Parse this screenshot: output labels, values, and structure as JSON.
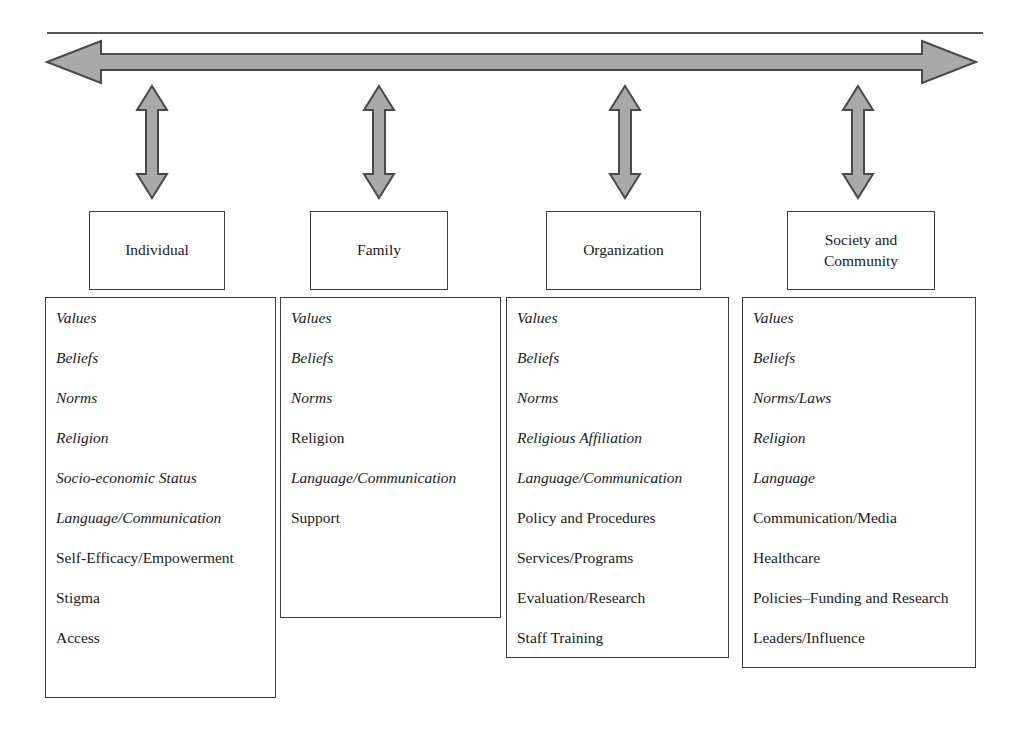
{
  "figure": {
    "colors": {
      "arrow_fill": "#a9a9a9",
      "arrow_stroke": "#4a4a4a",
      "box_border": "#3c3c3c",
      "rule": "#555555",
      "text": "#1a1a1a"
    }
  },
  "top_rule": {
    "label": "top-horizontal-rule"
  },
  "bottom_rule": {
    "label": "bottom-horizontal-rule"
  },
  "arrows": {
    "horizontal": {
      "name": "horizontal-double-headed-arrow",
      "direction": "double"
    },
    "vertical": [
      {
        "name": "vertical-double-headed-arrow-individual",
        "direction": "double"
      },
      {
        "name": "vertical-double-headed-arrow-family",
        "direction": "double"
      },
      {
        "name": "vertical-double-headed-arrow-organization",
        "direction": "double"
      },
      {
        "name": "vertical-double-headed-arrow-society",
        "direction": "double"
      }
    ]
  },
  "columns": [
    {
      "header": "Individual",
      "items": [
        {
          "text": "Values",
          "italic": true
        },
        {
          "text": "Beliefs",
          "italic": true
        },
        {
          "text": "Norms",
          "italic": true
        },
        {
          "text": "Religion",
          "italic": true
        },
        {
          "text": "Socio-economic Status",
          "italic": true
        },
        {
          "text": "Language/Communication",
          "italic": true
        },
        {
          "text": "Self-Efficacy/Empowerment",
          "italic": false
        },
        {
          "text": "Stigma",
          "italic": false
        },
        {
          "text": "Access",
          "italic": false
        }
      ]
    },
    {
      "header": "Family",
      "items": [
        {
          "text": "Values",
          "italic": true
        },
        {
          "text": "Beliefs",
          "italic": true
        },
        {
          "text": "Norms",
          "italic": true
        },
        {
          "text": "Religion",
          "italic": false
        },
        {
          "text": "Language/Communication",
          "italic": true
        },
        {
          "text": "Support",
          "italic": false
        }
      ]
    },
    {
      "header": "Organization",
      "items": [
        {
          "text": "Values",
          "italic": true
        },
        {
          "text": "Beliefs",
          "italic": true
        },
        {
          "text": "Norms",
          "italic": true
        },
        {
          "text": "Religious Affiliation",
          "italic": true
        },
        {
          "text": "Language/Communication",
          "italic": true
        },
        {
          "text": "Policy and Procedures",
          "italic": false
        },
        {
          "text": "Services/Programs",
          "italic": false
        },
        {
          "text": "Evaluation/Research",
          "italic": false
        },
        {
          "text": "Staff Training",
          "italic": false
        }
      ]
    },
    {
      "header": "Society and Community",
      "items": [
        {
          "text": "Values",
          "italic": true
        },
        {
          "text": "Beliefs",
          "italic": true
        },
        {
          "text": "Norms/Laws",
          "italic": true
        },
        {
          "text": "Religion",
          "italic": true
        },
        {
          "text": "Language",
          "italic": true
        },
        {
          "text": "Communication/Media",
          "italic": false
        },
        {
          "text": "Healthcare",
          "italic": false
        },
        {
          "text": "Policies–Funding and Research",
          "italic": false
        },
        {
          "text": "Leaders/Influence",
          "italic": false
        }
      ]
    }
  ]
}
